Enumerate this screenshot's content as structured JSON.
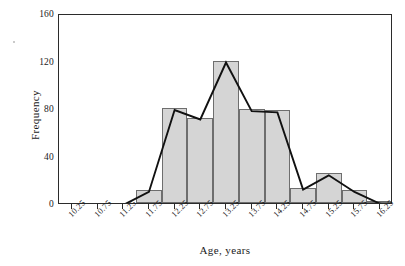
{
  "chart_data": {
    "type": "bar",
    "title": "",
    "subtitle": "",
    "xlabel": "Age, years",
    "ylabel": "Frequency",
    "categories": [
      "10.25",
      "10.75",
      "11.25",
      "11.75",
      "12.25",
      "12.75",
      "13.25",
      "13.75",
      "14.25",
      "14.75",
      "15.25",
      "15.75",
      "16.25"
    ],
    "values": [
      0,
      0,
      0,
      11,
      80,
      72,
      120,
      79,
      78,
      13,
      25,
      11,
      1
    ],
    "series": [
      {
        "name": "Frequency histogram",
        "values": [
          0,
          0,
          0,
          11,
          80,
          72,
          120,
          79,
          78,
          13,
          25,
          11,
          1
        ]
      },
      {
        "name": "Frequency polygon",
        "values": [
          0,
          0,
          0,
          11,
          80,
          72,
          120,
          79,
          78,
          13,
          25,
          11,
          1
        ]
      }
    ],
    "ylim": [
      0,
      160
    ],
    "yticks": [
      0,
      40,
      80,
      120,
      160
    ],
    "ytick_labels": [
      "0",
      "40",
      "80",
      "120",
      "160"
    ],
    "xtick_labels": [
      "10.25",
      "10.75",
      "11.25",
      "11.75",
      "12.25",
      "12.75",
      "13.25",
      "13.75",
      "14.25",
      "14.75",
      "15.25",
      "15.75",
      "16.25"
    ],
    "grid": false,
    "legend": "none",
    "bar_fill_color": "#d5d5d5",
    "bar_edge_color": "#6e6e6e",
    "polygon_color": "#111111",
    "axis_color": "#2b2b2b",
    "bin_width": 0.5,
    "annotations": []
  },
  "axes": {
    "y_title": "Frequency",
    "x_title": "Age, years"
  }
}
